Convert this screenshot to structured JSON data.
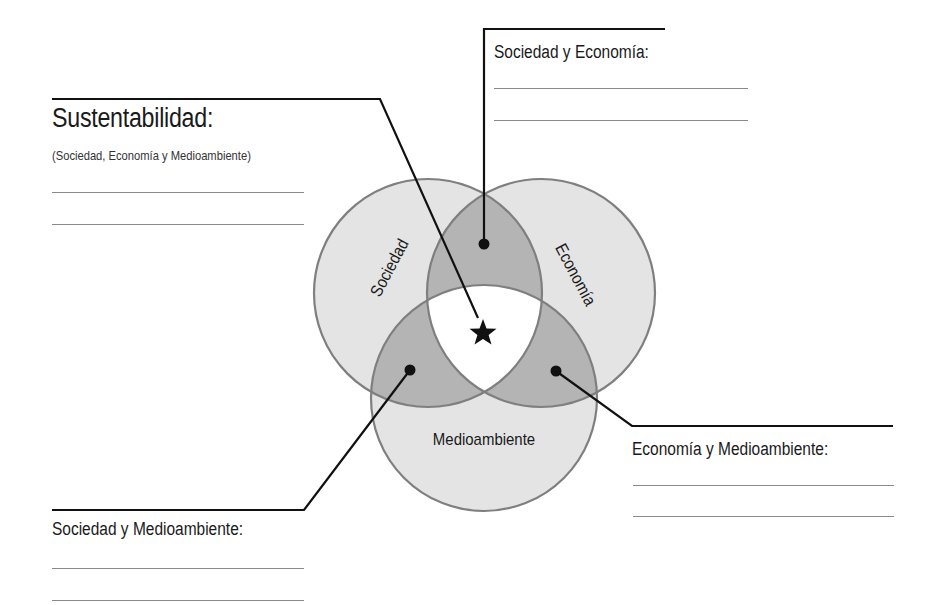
{
  "diagram": {
    "type": "venn",
    "sets": [
      {
        "id": "sociedad",
        "label": "Sociedad"
      },
      {
        "id": "economia",
        "label": "Economía"
      },
      {
        "id": "medioambiente",
        "label": "Medioambiente"
      }
    ],
    "colors": {
      "circle_fill": "#e4e4e4",
      "pair_overlap_fill": "#b4b4b4",
      "triple_overlap_fill": "#ffffff",
      "outline": "#7f7f7f",
      "leader_line": "#111111"
    },
    "center_marker": "star-icon"
  },
  "callouts": {
    "sustentabilidad": {
      "title": "Sustentabilidad:",
      "subtitle": "(Sociedad, Economía y Medioambiente)",
      "answer_lines": 2
    },
    "sociedad_economia": {
      "title": "Sociedad y Economía:",
      "answer_lines": 2
    },
    "economia_medioambiente": {
      "title": "Economía y Medioambiente:",
      "answer_lines": 2
    },
    "sociedad_medioambiente": {
      "title": "Sociedad y Medioambiente:",
      "answer_lines": 2
    }
  }
}
